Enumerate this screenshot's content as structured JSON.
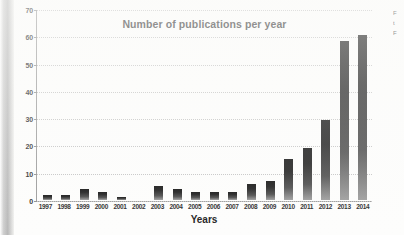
{
  "chart_data": {
    "type": "bar",
    "title": "Number of publications per year",
    "xlabel": "Years",
    "ylabel": "",
    "ylim": [
      0,
      70
    ],
    "yticks": [
      0,
      10,
      20,
      30,
      40,
      50,
      60,
      70
    ],
    "grid": true,
    "legend": null,
    "categories": [
      "1997",
      "1998",
      "1999",
      "2000",
      "2001",
      "2002",
      "2003",
      "2004",
      "2005",
      "2006",
      "2007",
      "2008",
      "2009",
      "2010",
      "2011",
      "2012",
      "2013",
      "2014"
    ],
    "values": [
      2,
      2,
      4,
      3,
      1,
      0,
      5,
      4,
      3,
      3,
      3,
      6,
      7,
      15,
      19,
      29,
      58,
      60
    ]
  },
  "colors": {
    "bar_dark": "#111111",
    "bar_light": "#9d9d9d",
    "axis": "#9a9a9a",
    "grid": "#c3c3c3",
    "text": "#2b2b2b",
    "page_background": "#fdfdfc"
  },
  "edge_caption": {
    "line1": "F",
    "line2": "t",
    "line3": "F"
  }
}
